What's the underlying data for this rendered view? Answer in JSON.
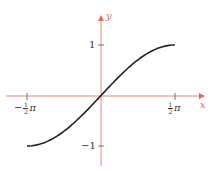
{
  "chart_data": {
    "type": "line",
    "title": "",
    "function": "y = sin x",
    "xlabel": "x",
    "ylabel": "y",
    "xlim": [
      -1.5708,
      1.5708
    ],
    "ylim": [
      -1,
      1
    ],
    "grid": false,
    "legend": null,
    "x_ticks": [
      {
        "value": -1.5708,
        "label": "-½π",
        "sign": "−",
        "num": "1",
        "den": "2",
        "suffix": "π"
      },
      {
        "value": 1.5708,
        "label": "½π",
        "sign": "",
        "num": "1",
        "den": "2",
        "suffix": "π"
      }
    ],
    "y_ticks": [
      {
        "value": 1,
        "label": "1"
      },
      {
        "value": -1,
        "label": "−1"
      }
    ],
    "series": [
      {
        "name": "sin x",
        "color": "#222222",
        "x": [
          -1.5708,
          -1.1781,
          -0.7854,
          -0.3927,
          0,
          0.3927,
          0.7854,
          1.1781,
          1.5708
        ],
        "y": [
          -1,
          -0.9239,
          -0.7071,
          -0.3827,
          0,
          0.3827,
          0.7071,
          0.9239,
          1
        ]
      }
    ],
    "axis_color": "#e86a5c"
  }
}
